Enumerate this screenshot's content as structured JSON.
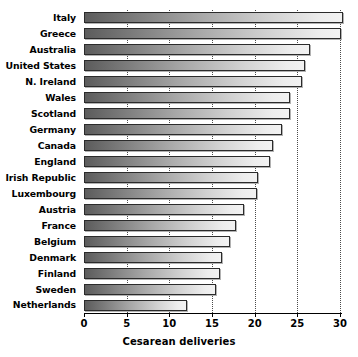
{
  "chart_data": {
    "type": "bar",
    "orientation": "horizontal",
    "title": "",
    "xlabel": "Cesarean deliveries",
    "ylabel": "",
    "xlim": [
      0,
      30
    ],
    "xticks": [
      0,
      5,
      10,
      15,
      20,
      25,
      30
    ],
    "xtick_labels": [
      "0",
      "5",
      "10",
      "15",
      "20",
      "25",
      "30"
    ],
    "grid": true,
    "grid_axis": "x",
    "grid_style": "dotted",
    "legend": null,
    "categories": [
      "Italy",
      "Greece",
      "Australia",
      "United States",
      "N. Ireland",
      "Wales",
      "Scotland",
      "Germany",
      "Canada",
      "England",
      "Irish Republic",
      "Luxembourg",
      "Austria",
      "France",
      "Belgium",
      "Denmark",
      "Finland",
      "Sweden",
      "Netherlands"
    ],
    "values": [
      30.4,
      30.1,
      26.5,
      25.9,
      25.6,
      24.1,
      24.1,
      23.2,
      22.2,
      21.8,
      20.4,
      20.3,
      18.8,
      17.8,
      17.1,
      16.2,
      15.9,
      15.5,
      12.1
    ],
    "bar_fill": "gradient-dark-to-light",
    "bar_edge_color": "#2b2b2b",
    "background_color": "#ffffff",
    "text_color": "#000000",
    "gridline_color": "#4a4a4a"
  }
}
